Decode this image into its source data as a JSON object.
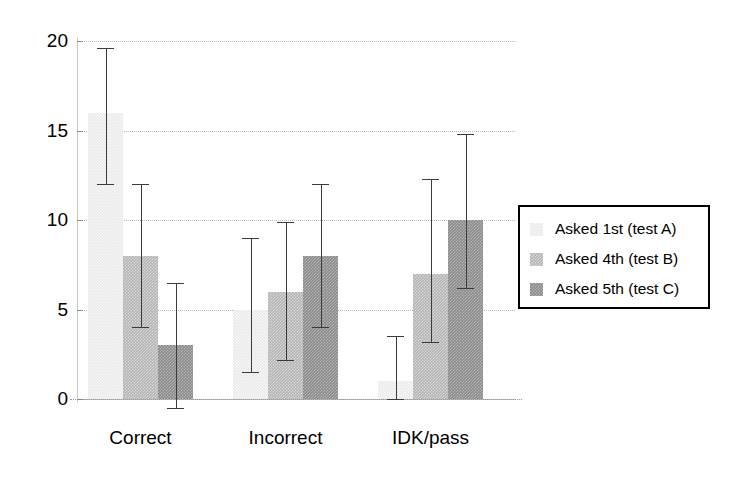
{
  "chart_data": {
    "type": "bar",
    "title": "",
    "subtitle": "",
    "xlabel": "",
    "ylabel": "",
    "categories": [
      "Correct",
      "Incorrect",
      "IDK/pass"
    ],
    "ylim": [
      0,
      20
    ],
    "yticks": [
      0,
      5,
      10,
      15,
      20
    ],
    "ytick_labels": [
      "0",
      "5",
      "10",
      "15",
      "20"
    ],
    "grid": true,
    "legend_position": "right",
    "orientation": "vertical",
    "error_bars": true,
    "series": [
      {
        "name": "Asked 1st (test A)",
        "color": "#e9e9e9",
        "values": [
          16,
          5,
          1
        ],
        "err_low": [
          12,
          1.5,
          0
        ],
        "err_high": [
          19.6,
          9,
          3.5
        ]
      },
      {
        "name": "Asked 4th (test B)",
        "color": "#b4b4b4",
        "values": [
          8,
          6,
          7
        ],
        "err_low": [
          4,
          2.2,
          3.2
        ],
        "err_high": [
          12,
          9.9,
          12.3
        ]
      },
      {
        "name": "Asked 5th (test C)",
        "color": "#8b8b8b",
        "values": [
          3,
          8,
          10
        ],
        "err_low": [
          -0.5,
          4,
          6.2
        ],
        "err_high": [
          6.5,
          12,
          14.8
        ]
      }
    ]
  },
  "legend": {
    "items": [
      {
        "label": "Asked 1st (test A)",
        "swatch": "s0"
      },
      {
        "label": "Asked 4th (test B)",
        "swatch": "s1"
      },
      {
        "label": "Asked 5th (test C)",
        "swatch": "s2"
      }
    ]
  }
}
